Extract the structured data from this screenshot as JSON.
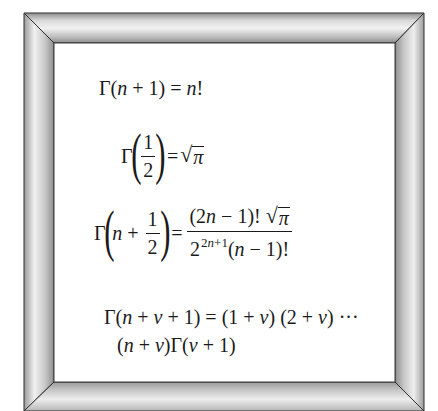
{
  "frame": {
    "style": "beveled-silver-picture-frame",
    "colors": {
      "outline": "#2e2e2e",
      "highlight": "#f4f4f4",
      "midtone": "#c2c2c2",
      "shadow": "#8a8a8a",
      "panel": "#ffffff"
    }
  },
  "equations": [
    {
      "id": "gamma-integer",
      "latex": "\\Gamma(n+1) = n!",
      "parts": {
        "gamma": "Γ",
        "lhs_args": "(n + 1)",
        "lhs_open": "(",
        "lhs_n": "n",
        "lhs_plus": " + 1)",
        "eq": " = ",
        "rhs_n": "n",
        "rhs_bang": "!"
      }
    },
    {
      "id": "gamma-half",
      "latex": "\\Gamma\\left(\\frac{1}{2}\\right) = \\sqrt{\\pi}",
      "parts": {
        "gamma": "Γ",
        "open": "(",
        "num": "1",
        "den": "2",
        "close": ")",
        "eq": "=",
        "radical": "√",
        "pi": "π"
      }
    },
    {
      "id": "gamma-half-integer",
      "latex": "\\Gamma\\left(n+\\frac{1}{2}\\right) = \\frac{(2n-1)!\\sqrt{\\pi}}{2^{2n+1}(n-1)!}",
      "parts": {
        "gamma": "Γ",
        "open": "(",
        "n": "n",
        "plus": " + ",
        "num": "1",
        "den": "2",
        "close": ")",
        "eq": "=",
        "rhs_num_a": "(2",
        "rhs_num_n": "n",
        "rhs_num_b": " − 1)!",
        "radical": "√",
        "pi": "π",
        "rhs_den_base": "2",
        "rhs_den_exp_a": "2",
        "rhs_den_exp_n": "n",
        "rhs_den_exp_b": "+1",
        "rhs_den_open": "(",
        "rhs_den_n": "n",
        "rhs_den_b": " − 1)!"
      }
    },
    {
      "id": "gamma-recurrence",
      "latex": "\\Gamma(n+\\nu+1) = (1+\\nu)(2+\\nu)\\cdots(n+\\nu)\\Gamma(\\nu+1)",
      "line1": {
        "gamma": "Γ",
        "open": "(",
        "n": "n",
        "plus1": " + ",
        "v": "v",
        "rest": " + 1) = (1 + ",
        "v2": "v",
        "mid": ") (2 + ",
        "v3": "v",
        "tail": ") ···"
      },
      "line2": {
        "open": "(",
        "n": "n",
        "plus": " + ",
        "v": "v",
        "close": ")",
        "gamma": "Γ",
        "open2": "(",
        "v2": "v",
        "tail": " + 1)"
      }
    }
  ]
}
